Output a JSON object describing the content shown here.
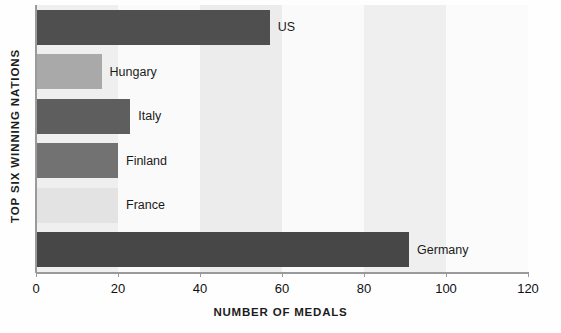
{
  "chart_data": {
    "type": "bar",
    "orientation": "horizontal",
    "title": "",
    "xlabel": "NUMBER OF MEDALS",
    "ylabel": "TOP SIX WINNING NATIONS",
    "categories": [
      "US",
      "Hungary",
      "Italy",
      "Finland",
      "France",
      "Germany"
    ],
    "values": [
      57,
      16,
      23,
      20,
      20,
      91
    ],
    "xlim": [
      0,
      120
    ],
    "xticks": [
      0,
      20,
      40,
      60,
      80,
      100,
      120
    ],
    "xticklabels": [
      "0",
      "20",
      "40",
      "60",
      "80",
      "100",
      "120"
    ],
    "grid": false,
    "legend": false,
    "bar_colors": [
      "#4f4f4f",
      "#a9a9a9",
      "#5e5e5e",
      "#727272",
      "#e3e3e3",
      "#474747"
    ],
    "background_bands": [
      {
        "from": 0,
        "to": 20,
        "color": "#efefef"
      },
      {
        "from": 20,
        "to": 40,
        "color": "#fafafa"
      },
      {
        "from": 40,
        "to": 60,
        "color": "#ececec"
      },
      {
        "from": 60,
        "to": 80,
        "color": "#fafafa"
      },
      {
        "from": 80,
        "to": 100,
        "color": "#efefef"
      },
      {
        "from": 100,
        "to": 120,
        "color": "#fbfbfb"
      }
    ]
  },
  "axis": {
    "line_color": "#9a9a9a"
  }
}
